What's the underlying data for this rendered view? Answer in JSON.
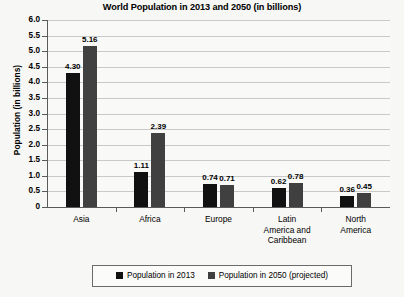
{
  "chart_data": {
    "type": "bar",
    "title": "World Population in 2013 and 2050 (in billions)",
    "xlabel": "",
    "ylabel": "Population (in billions)",
    "ylim": [
      0,
      6.0
    ],
    "ytick_step": 0.5,
    "grid": true,
    "legend_position": "bottom",
    "categories": [
      "Asia",
      "Africa",
      "Europe",
      "Latin\nAmerica and\nCaribbean",
      "North\nAmerica"
    ],
    "ytick_labels": [
      "6.0",
      "5.5",
      "5.0",
      "4.5",
      "4.0",
      "3.5",
      "3.0",
      "2.5",
      "2.0",
      "1.5",
      "1.0",
      "0.5",
      "0"
    ],
    "ytick_values": [
      6.0,
      5.5,
      5.0,
      4.5,
      4.0,
      3.5,
      3.0,
      2.5,
      2.0,
      1.5,
      1.0,
      0.5,
      0
    ],
    "series": [
      {
        "name": "Population in 2013",
        "color": "#111111",
        "values": [
          4.3,
          1.11,
          0.74,
          0.62,
          0.36
        ],
        "labels": [
          "4.30",
          "1.11",
          "0.74",
          "0.62",
          "0.36"
        ]
      },
      {
        "name": "Population in 2050 (projected)",
        "color": "#404040",
        "values": [
          5.16,
          2.39,
          0.71,
          0.78,
          0.45
        ],
        "labels": [
          "5.16",
          "2.39",
          "0.71",
          "0.78",
          "0.45"
        ]
      }
    ]
  },
  "colors": {
    "background": "#f7f7f5",
    "gridline": "#c9c9c9",
    "axis": "#5a5a5a",
    "series_2013": "#111111",
    "series_2050": "#404040"
  }
}
